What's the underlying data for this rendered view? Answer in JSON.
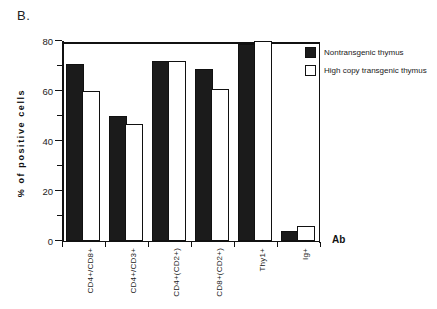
{
  "panel": {
    "label": "B."
  },
  "axis_titles": {
    "y": "% of positive cells",
    "x": "Ab"
  },
  "legend": {
    "entries": [
      {
        "label": "Nontransgenic thymus",
        "swatch": "filled-square-icon",
        "color": "#1b1b1b"
      },
      {
        "label": "High copy transgenic thymus",
        "swatch": "open-square-icon",
        "color": "#ffffff"
      }
    ]
  },
  "y_ticks": {
    "major": [
      "0",
      "20",
      "40",
      "60",
      "80"
    ],
    "minor": [
      "10",
      "30",
      "50",
      "70"
    ]
  },
  "chart_data": {
    "type": "bar",
    "title": "B.",
    "xlabel": "Ab",
    "ylabel": "% of positive cells",
    "ylim": [
      0,
      80
    ],
    "ytick_values": [
      0,
      20,
      40,
      60,
      80
    ],
    "yminor_tick_values": [
      10,
      30,
      50,
      70
    ],
    "grid": false,
    "legend_position": "right-top",
    "categories": [
      "CD4+/CD8+",
      "CD4+/CD3+",
      "CD4+(CD2+)",
      "CD8+(CD2+)",
      "Thy1+",
      "Ig+"
    ],
    "series": [
      {
        "name": "Nontransgenic thymus",
        "color": "#1b1b1b",
        "style": "filled",
        "values": [
          70,
          49,
          71,
          68,
          78,
          3
        ]
      },
      {
        "name": "High copy transgenic thymus",
        "color": "#ffffff",
        "style": "open",
        "values": [
          59,
          46,
          71,
          60,
          79,
          5
        ]
      }
    ]
  }
}
